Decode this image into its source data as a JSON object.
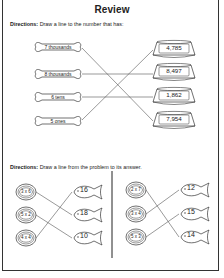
{
  "worksheet": {
    "title": "Review",
    "section1": {
      "directions_label": "Directions:",
      "directions_text": " Draw a line to the number that has:",
      "bones": [
        "7 thousands",
        "8 thousands",
        "6 tens",
        "5 ones"
      ],
      "bowls": [
        "4,785",
        "8,497",
        "1,862",
        "7,954"
      ],
      "matches": [
        [
          0,
          3
        ],
        [
          1,
          1
        ],
        [
          2,
          2
        ],
        [
          3,
          0
        ]
      ]
    },
    "section2": {
      "directions_label": "Directions:",
      "directions_text": " Draw a line from the problem to its answer.",
      "left": {
        "problems": [
          "3 x 6",
          "5 x 2",
          "4 x 4"
        ],
        "answers": [
          "16",
          "18",
          "10"
        ],
        "matches": [
          [
            0,
            1
          ],
          [
            1,
            2
          ],
          [
            2,
            0
          ]
        ]
      },
      "right": {
        "problems": [
          "2 x 7",
          "3 x 4",
          "5 x 3"
        ],
        "answers": [
          "12",
          "15",
          "14"
        ],
        "matches": [
          [
            0,
            2
          ],
          [
            1,
            0
          ],
          [
            2,
            1
          ]
        ]
      }
    },
    "colors": {
      "ink": "#222222",
      "line": "#555555",
      "background": "#ffffff"
    }
  }
}
